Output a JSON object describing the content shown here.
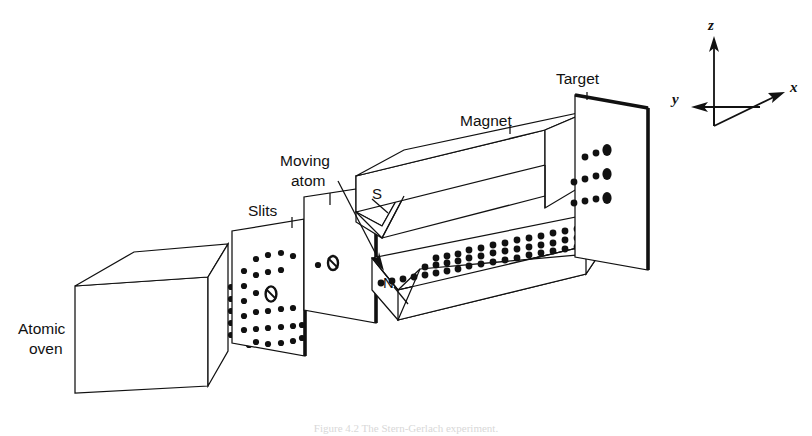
{
  "figure": {
    "caption": "Figure 4.2  The Stern-Gerlach experiment."
  },
  "labels": {
    "atomic_oven": "Atomic\noven",
    "atomic_oven_line1": "Atomic",
    "atomic_oven_line2": "oven",
    "slits": "Slits",
    "moving_atom_line1": "Moving",
    "moving_atom_line2": "atom",
    "magnet": "Magnet",
    "target": "Target",
    "pole_south": "S",
    "pole_north": "N"
  },
  "axes": {
    "z": "z",
    "x": "x",
    "y": "y",
    "origin": [
      714,
      126
    ]
  },
  "colors": {
    "ink": "#111111",
    "paper": "#ffffff",
    "caption_ink": "#d8d8d8"
  },
  "diagram_data": {
    "type": "schematic",
    "components": [
      {
        "name": "atomic-oven",
        "shape": "rectangular-box",
        "label": "Atomic oven"
      },
      {
        "name": "first-slit-plate",
        "shape": "plate-with-aperture",
        "label": "Slits"
      },
      {
        "name": "second-slit-plate",
        "shape": "plate-with-aperture",
        "label": "Slits"
      },
      {
        "name": "magnet-south-pole",
        "shape": "wedge-bar",
        "label": "S"
      },
      {
        "name": "magnet-north-pole",
        "shape": "grooved-bar",
        "label": "N"
      },
      {
        "name": "target-plate",
        "shape": "plate",
        "label": "Target"
      }
    ],
    "beam": {
      "description": "Atomic beam emitted from oven, collimated by two slits, split by inhomogeneous magnetic field into three bands on the target",
      "branches": 3
    }
  }
}
